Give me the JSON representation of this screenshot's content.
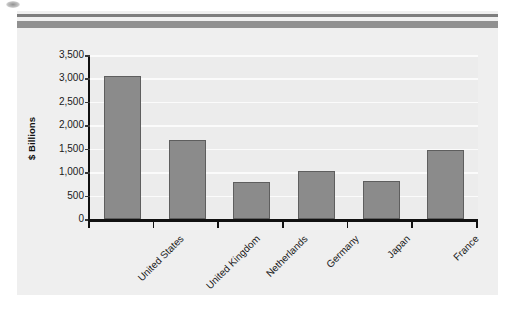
{
  "figure": {
    "background_color": "#efefef",
    "page_background": "#ffffff"
  },
  "chart_data": {
    "type": "bar",
    "title": "",
    "subtitle": "",
    "xlabel": "",
    "ylabel": "$ Billions",
    "categories": [
      "United States",
      "United Kingdom",
      "Netherlands",
      "Germany",
      "Japan",
      "France"
    ],
    "values": [
      3050,
      1680,
      790,
      1030,
      810,
      1470
    ],
    "series": [
      {
        "name": "",
        "values": [
          3050,
          1680,
          790,
          1030,
          810,
          1470
        ]
      }
    ],
    "ylim": [
      0,
      3500
    ],
    "ytick_values": [
      0,
      500,
      1000,
      1500,
      2000,
      2500,
      3000,
      3500
    ],
    "ytick_labels": [
      "0",
      "500",
      "1,000",
      "1,500",
      "2,000",
      "2,500",
      "3,000",
      "3,500"
    ],
    "grid": true,
    "grid_axis": "y",
    "grid_color": "#fbfbfb",
    "legend": false,
    "legend_position": "none",
    "bar_color": "#8b8b8b",
    "bar_edge_color": "#5e5e5e",
    "axis_color": "#111111",
    "plot_background": "#ececec",
    "xtick_label_rotation": -45,
    "annotations": []
  },
  "decorations": {
    "rule_thin_color": "#7d7d7d",
    "rule_thick_color": "#909090"
  }
}
